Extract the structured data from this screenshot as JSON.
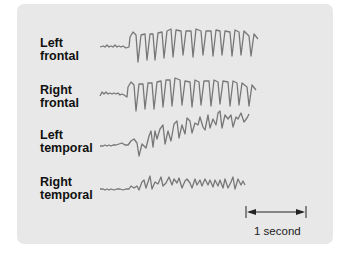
{
  "figure": {
    "panel_color": "#e8e8e8",
    "trace_color": "#777777",
    "channels": [
      {
        "line1": "Left",
        "line2": "frontal"
      },
      {
        "line1": "Right",
        "line2": "frontal"
      },
      {
        "line1": "Left",
        "line2": "temporal"
      },
      {
        "line1": "Right",
        "line2": "temporal"
      }
    ],
    "scale_bar": {
      "label": "1 second"
    }
  }
}
